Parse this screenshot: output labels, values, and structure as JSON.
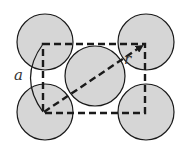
{
  "diagram": {
    "labels": {
      "side": "a",
      "radius": "r"
    },
    "colors": {
      "atom_fill": "#d6d6d6",
      "stroke": "#1a1a1a",
      "background": "#ffffff"
    },
    "atoms": [
      {
        "name": "top-left",
        "cx": 45,
        "cy": 42,
        "r": 28
      },
      {
        "name": "top-right",
        "cx": 146,
        "cy": 42,
        "r": 28
      },
      {
        "name": "bottom-left",
        "cx": 45,
        "cy": 112,
        "r": 28
      },
      {
        "name": "bottom-right",
        "cx": 146,
        "cy": 112,
        "r": 28
      },
      {
        "name": "center",
        "cx": 95,
        "cy": 76,
        "r": 30
      }
    ]
  }
}
